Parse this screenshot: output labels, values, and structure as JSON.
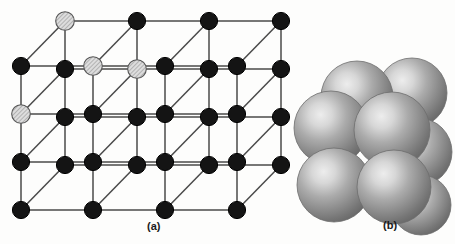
{
  "figure": {
    "background_color": "#fdfdfc",
    "panels": [
      {
        "id": "a",
        "caption": "(a)",
        "kind": "ball-and-stick lattice"
      },
      {
        "id": "b",
        "caption": "(b)",
        "kind": "space-filling sphere packing"
      }
    ]
  },
  "panel_a": {
    "caption": "(a)",
    "description": "Expanded ball-and-stick view of a face-centered cubic rock-salt lattice drawn in oblique projection. Alternating light hatched ions and solid dark ions occupy alternating lattice sites.",
    "colors": {
      "line": "#4a4a4a",
      "dark_ion_fill": "#141414",
      "dark_ion_stroke": "#000000",
      "light_ion_fill": "#d8d8d8",
      "light_ion_stroke": "#555555",
      "hatch_color": "#8a8a8a"
    },
    "geometry": {
      "origin_x": 21,
      "origin_y": 210,
      "step_x": 72,
      "step_y": -48,
      "depth_dx": 44,
      "depth_dy": -45,
      "grid_cols": 4,
      "grid_rows": 4,
      "depth_layers": 2,
      "node_radius": 8.6
    },
    "ion_labels": {
      "light": "larger hatched ion",
      "dark": "smaller dark ion"
    },
    "counts": {
      "total_nodes": 32,
      "light_nodes": 8,
      "dark_nodes": 24
    }
  },
  "panel_b": {
    "caption": "(b)",
    "description": "Space-filling model of the same unit cell showing shaded spheres in contact.",
    "colors": {
      "sphere_mid": "#9a9a9a",
      "sphere_highlight": "#e2e2e2",
      "sphere_shadow": "#5f5f5f",
      "sphere_edge": "#6d6d6d"
    },
    "spheres": [
      {
        "name": "back-top-left",
        "cx": 357,
        "cy": 97,
        "r": 36,
        "layer": 1
      },
      {
        "name": "back-top-right",
        "cx": 412,
        "cy": 93,
        "r": 35,
        "layer": 1
      },
      {
        "name": "mid-right",
        "cx": 418,
        "cy": 152,
        "r": 34,
        "layer": 1
      },
      {
        "name": "front-top-left",
        "cx": 331,
        "cy": 128,
        "r": 37,
        "layer": 2
      },
      {
        "name": "front-top-right",
        "cx": 392,
        "cy": 130,
        "r": 38,
        "layer": 2
      },
      {
        "name": "front-bottom-left",
        "cx": 334,
        "cy": 185,
        "r": 37,
        "layer": 3
      },
      {
        "name": "front-bottom-right",
        "cx": 394,
        "cy": 187,
        "r": 37,
        "layer": 3
      },
      {
        "name": "back-bottom-right",
        "cx": 421,
        "cy": 205,
        "r": 30,
        "layer": 1
      }
    ]
  }
}
